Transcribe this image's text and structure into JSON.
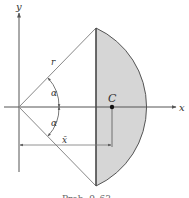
{
  "figure": {
    "axes": {
      "x_label": "x",
      "y_label": "y"
    },
    "labels": {
      "radius": "r",
      "angle_upper": "α",
      "angle_lower": "α",
      "centroid": "C",
      "centroid_distance": "x̄"
    },
    "caption": "Prob. 9–63",
    "colors": {
      "line": "#555555",
      "shading": "#d6d6d6",
      "centroid_dot": "#111111"
    }
  }
}
